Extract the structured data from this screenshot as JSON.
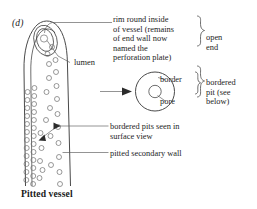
{
  "figure": {
    "panel_label": "(d)",
    "caption": "Pitted vessel",
    "accent_color": "#1c1c1c",
    "line_color": "#4a4a4a",
    "background_color": "#ffffff"
  },
  "annotations": {
    "rim": "rim round inside\nof vessel (remains\nof end wall now\nnamed the\nperforation plate)",
    "open_end": "open\nend",
    "lumen": "lumen",
    "border": "border",
    "pore": "pore",
    "bordered_pit": "bordered\npit (see\nbelow)",
    "bordered_pits_surface": "bordered pits seen in\nsurface view",
    "pitted_secondary_wall": "pitted secondary wall"
  },
  "diagram_parts": {
    "vessel_name": "pitted-vessel-outline",
    "perforation_plate_name": "perforation-plate-rim",
    "lumen_name": "lumen-opening",
    "bordered_pit_outer": "bordered-pit-border-circle",
    "bordered_pit_inner": "bordered-pit-pore-circle",
    "pointer_arrow": "magnification-arrow"
  }
}
